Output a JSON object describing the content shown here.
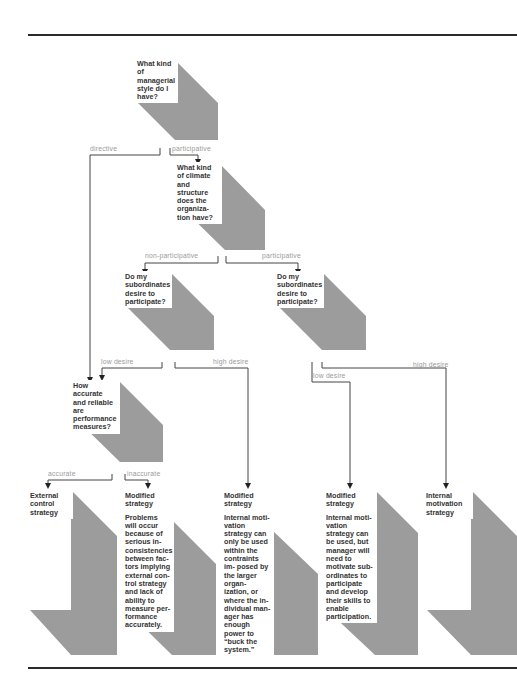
{
  "diagram": {
    "title_fragment_visible": false,
    "colors": {
      "shape_fill": "#9c9c9c",
      "rule": "#2a2a2a",
      "connector": "#444444",
      "branch_label": "#9a9a9a",
      "text": "#333333"
    },
    "questions": {
      "q1": "What kind of managerial style do I have?",
      "q2": "What kind of climate and structure does the organiza- tion have?",
      "q3a": "Do my subordinates desire to participate?",
      "q3b": "Do my subordinates desire to participate?",
      "q4": "How accurate and reliable are performance measures?"
    },
    "branch_labels": {
      "directive": "directive",
      "participative_1": "participative",
      "non_participative": "non-participative",
      "participative_2": "participative",
      "low_desire_1": "low desire",
      "high_desire_1": "high desire",
      "low_desire_2": "low desire",
      "high_desire_2": "high desire",
      "accurate": "accurate",
      "inaccurate": "inaccurate"
    },
    "outcomes": [
      {
        "title": "External control strategy",
        "body": ""
      },
      {
        "title": "Modified strategy",
        "body": "Problems will occur because of serious in- consistencies between fac- tors implying external con- trol strategy and lack of ability to measure per- formance accurately."
      },
      {
        "title": "Modified strategy",
        "body": "Internal moti- vation strategy can only be used within the contraints im- posed by the larger organ- ization, or where the in- dividual man- ager has enough power to “buck the system.”"
      },
      {
        "title": "Modified strategy",
        "body": "Internal moti- vation strategy can be used, but manager will need to motivate sub- ordinates to participate and develop their skills to enable participation."
      },
      {
        "title": "Internal motivation strategy",
        "body": ""
      }
    ]
  }
}
